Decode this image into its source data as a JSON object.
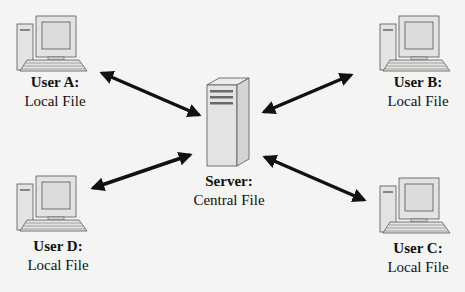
{
  "diagram": {
    "server": {
      "title": "Server:",
      "subtitle": "Central File"
    },
    "clients": [
      {
        "id": "A",
        "title": "User A:",
        "subtitle": "Local File"
      },
      {
        "id": "B",
        "title": "User B:",
        "subtitle": "Local File"
      },
      {
        "id": "C",
        "title": "User C:",
        "subtitle": "Local File"
      },
      {
        "id": "D",
        "title": "User D:",
        "subtitle": "Local File"
      }
    ],
    "connections": [
      {
        "from": "A",
        "to": "server",
        "type": "bidirectional"
      },
      {
        "from": "B",
        "to": "server",
        "type": "bidirectional"
      },
      {
        "from": "C",
        "to": "server",
        "type": "bidirectional"
      },
      {
        "from": "D",
        "to": "server",
        "type": "bidirectional"
      }
    ],
    "colors": {
      "device_fill": "#e3e3e1",
      "device_stroke": "#555555",
      "arrow": "#111111",
      "stripe": "#6a6a6a"
    }
  }
}
